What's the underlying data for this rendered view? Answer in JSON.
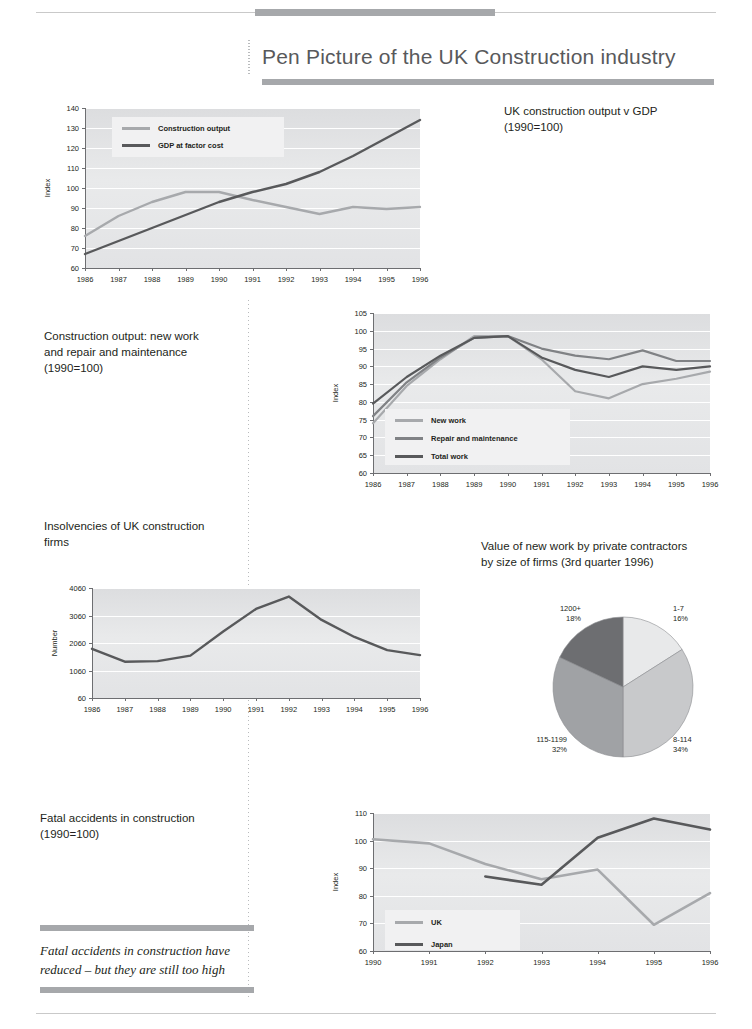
{
  "page": {
    "title": "Pen Picture of the UK Construction industry"
  },
  "captions": {
    "gdp": "UK construction output v GDP\n(1990=100)",
    "gdp_line1": "UK construction output v GDP",
    "gdp_line2": "(1990=100)",
    "newwork_line1": "Construction output: new work",
    "newwork_line2": "and repair and maintenance",
    "newwork_line3": "(1990=100)",
    "insolvency_line1": "Insolvencies of UK construction",
    "insolvency_line2": "firms",
    "pie_line1": "Value of new work by private contractors",
    "pie_line2": "by size of firms (3rd quarter 1996)",
    "fatal_line1": "Fatal accidents in construction",
    "fatal_line2": "(1990=100)"
  },
  "pullquote": {
    "line1": "Fatal accidents in construction have",
    "line2": "reduced – but they are still too high"
  },
  "colors": {
    "light": "#a7a9ac",
    "mid": "#808285",
    "dark": "#58595b",
    "darkest": "#414042",
    "plot_bg": "#e6e7e8",
    "rule": "#a6a8ab",
    "pie_1": "#e8e9ea",
    "pie_2": "#c8c9cb",
    "pie_3": "#a0a2a5",
    "pie_4": "#6d6e71"
  },
  "chart_data": [
    {
      "id": "gdp",
      "type": "line",
      "title": "UK construction output v GDP (1990=100)",
      "xlabel": "",
      "ylabel": "Index",
      "x": [
        "1986",
        "1987",
        "1988",
        "1989",
        "1990",
        "1991",
        "1992",
        "1993",
        "1994",
        "1995",
        "1996"
      ],
      "ylim": [
        60,
        140
      ],
      "yticks": [
        60,
        70,
        80,
        90,
        100,
        110,
        120,
        130,
        140
      ],
      "grid": true,
      "legend_position": "inside-top-left",
      "series": [
        {
          "name": "Construction output",
          "color": "#a7a9ac",
          "values": [
            76,
            86,
            93,
            98,
            98,
            94,
            90.5,
            87,
            90.5,
            89.5,
            90.5
          ]
        },
        {
          "name": "GDP at factor cost",
          "color": "#58595b",
          "values": [
            67,
            73.5,
            80,
            86.5,
            93,
            98,
            102,
            108,
            116,
            125,
            134
          ]
        }
      ]
    },
    {
      "id": "newwork",
      "type": "line",
      "title": "Construction output: new work and repair and maintenance (1990=100)",
      "xlabel": "",
      "ylabel": "Index",
      "x": [
        "1986",
        "1987",
        "1988",
        "1989",
        "1990",
        "1991",
        "1992",
        "1993",
        "1994",
        "1995",
        "1996"
      ],
      "ylim": [
        60,
        105
      ],
      "yticks": [
        60,
        65,
        70,
        75,
        80,
        85,
        90,
        95,
        100,
        105
      ],
      "grid": true,
      "legend_position": "inside-bottom-left",
      "series": [
        {
          "name": "New work",
          "color": "#a7a9ac",
          "values": [
            74,
            84.5,
            92,
            98.5,
            98.5,
            92,
            83,
            81,
            85,
            86.5,
            88.5
          ]
        },
        {
          "name": "Repair and maintenance",
          "color": "#808285",
          "values": [
            76,
            85.5,
            92.5,
            98,
            98.5,
            95,
            93,
            92,
            94.5,
            91.5,
            91.5
          ]
        },
        {
          "name": "Total work",
          "color": "#58595b",
          "values": [
            79.5,
            87,
            93,
            98,
            98.5,
            92.5,
            89,
            87,
            90,
            89,
            90
          ]
        }
      ]
    },
    {
      "id": "insolvencies",
      "type": "line",
      "title": "Insolvencies of UK construction firms",
      "xlabel": "",
      "ylabel": "Number",
      "x": [
        "1986",
        "1987",
        "1988",
        "1989",
        "1990",
        "1991",
        "1992",
        "1993",
        "1994",
        "1995",
        "1996"
      ],
      "ylim": [
        60,
        4060
      ],
      "yticks": [
        60,
        1060,
        2060,
        3060,
        4060
      ],
      "grid": true,
      "legend_position": "none",
      "series": [
        {
          "name": "Insolvencies",
          "color": "#58595b",
          "values": [
            1850,
            1380,
            1400,
            1600,
            2480,
            3300,
            3750,
            2900,
            2280,
            1800,
            1620
          ]
        }
      ]
    },
    {
      "id": "pie",
      "type": "pie",
      "title": "Value of new work by private contractors by size of firms (3rd quarter 1996)",
      "labels": [
        "1-7",
        "8-114",
        "115-1199",
        "1200+"
      ],
      "values": [
        16,
        34,
        32,
        18
      ],
      "value_suffix": "%",
      "colors": [
        "#e8e9ea",
        "#c8c9cb",
        "#a0a2a5",
        "#6d6e71"
      ],
      "legend_position": "outside-labels"
    },
    {
      "id": "fatal",
      "type": "line",
      "title": "Fatal accidents in construction (1990=100)",
      "xlabel": "",
      "ylabel": "Index",
      "x": [
        "1990",
        "1991",
        "1992",
        "1993",
        "1994",
        "1995",
        "1996"
      ],
      "ylim": [
        60,
        110
      ],
      "yticks": [
        60,
        70,
        80,
        90,
        100,
        110
      ],
      "grid": true,
      "legend_position": "inside-bottom-left",
      "series": [
        {
          "name": "UK",
          "color": "#a7a9ac",
          "values": [
            100.5,
            99,
            91.5,
            86,
            89.5,
            69.5,
            81
          ]
        },
        {
          "name": "Japan",
          "color": "#58595b",
          "values": [
            null,
            null,
            87,
            84,
            101,
            108,
            104
          ]
        }
      ]
    }
  ]
}
